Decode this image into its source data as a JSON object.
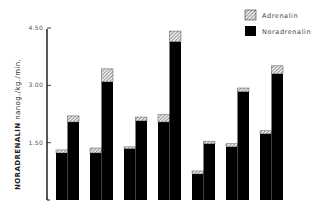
{
  "chart_data": {
    "type": "bar",
    "stacked": true,
    "title": "",
    "xlabel": "",
    "ylabel_bold": "NORADRENALIN",
    "ylabel_rest": " nanog./kg./min.",
    "ylim": [
      0,
      4.5
    ],
    "yticks": [
      1.5,
      3.0,
      4.5
    ],
    "ytick_labels": [
      "1.50",
      "3.00",
      "4.50"
    ],
    "grid": false,
    "legend_position": "top-right",
    "groups": 7,
    "bars_per_group": 2,
    "series": [
      {
        "name": "Noradrenalin",
        "pattern": "solid-black",
        "values": [
          1.23,
          2.04,
          1.23,
          3.09,
          1.34,
          2.07,
          2.04,
          4.14,
          0.68,
          1.47,
          1.39,
          2.83,
          1.73,
          3.3
        ]
      },
      {
        "name": "Adrenalin",
        "pattern": "diagonal-hatch",
        "values": [
          0.08,
          0.16,
          0.13,
          0.34,
          0.05,
          0.1,
          0.19,
          0.28,
          0.08,
          0.07,
          0.08,
          0.1,
          0.08,
          0.21
        ]
      }
    ],
    "legend": [
      {
        "label": "Adrenalin",
        "pattern": "diagonal-hatch"
      },
      {
        "label": "Noradrenalin",
        "pattern": "solid-black"
      }
    ]
  }
}
